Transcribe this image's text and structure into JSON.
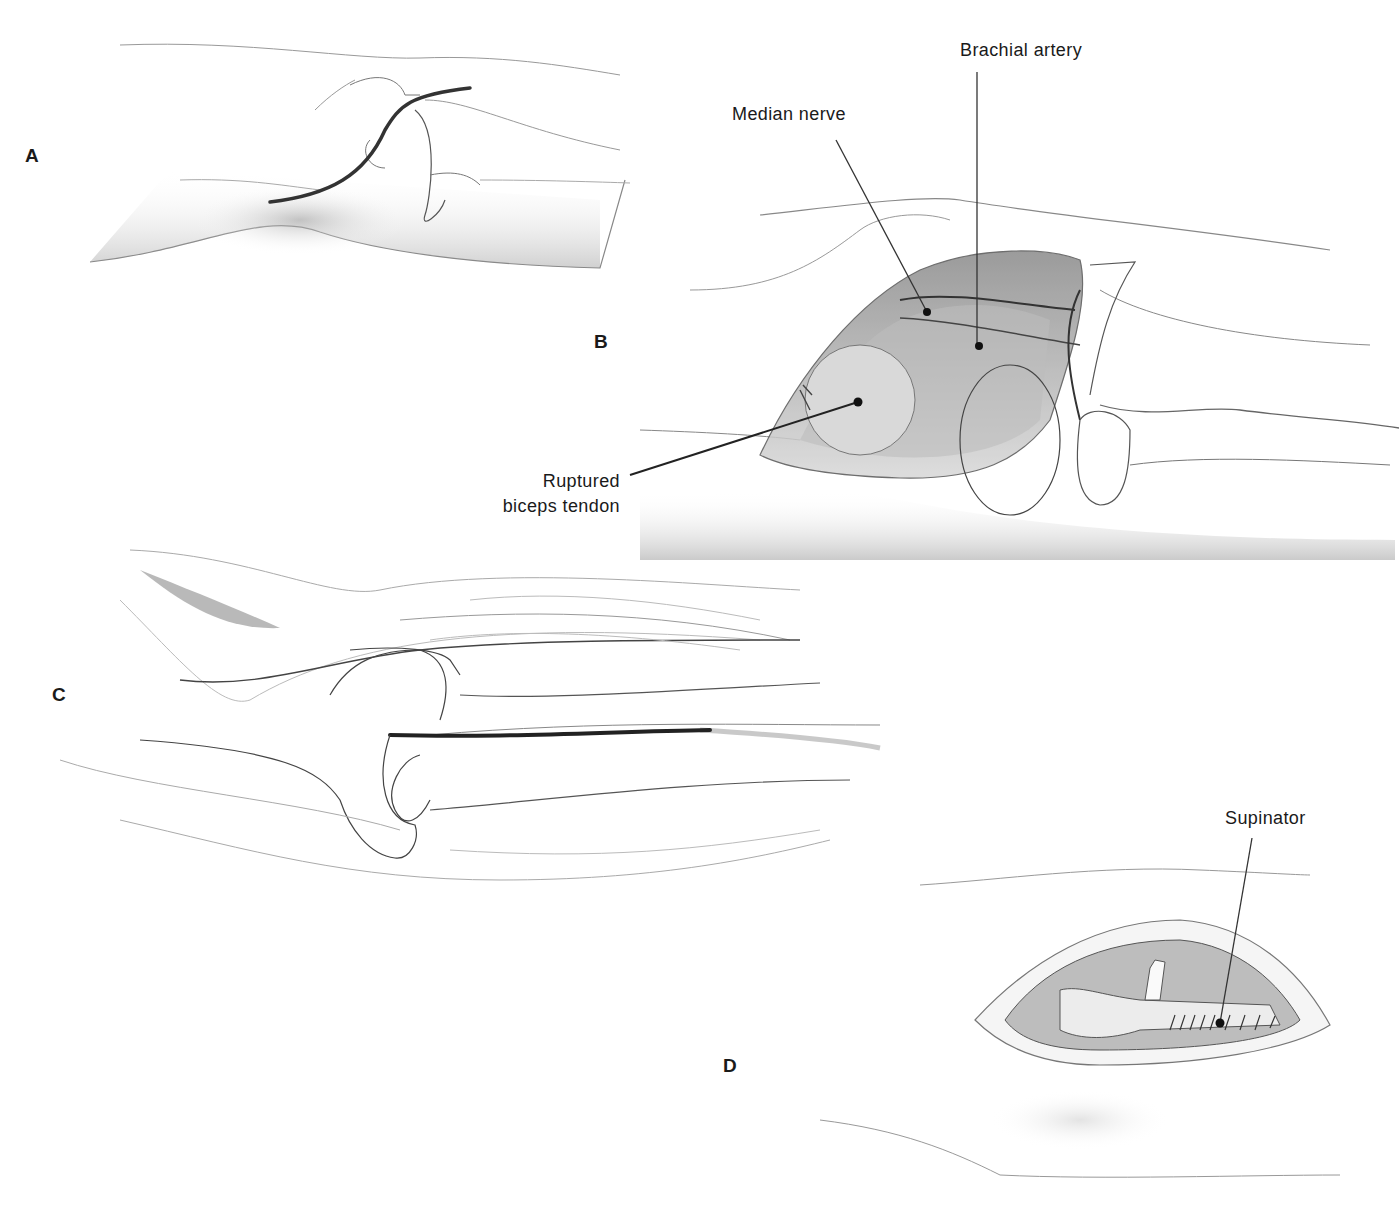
{
  "figure": {
    "panels": [
      {
        "id": "A",
        "letter": "A"
      },
      {
        "id": "B",
        "letter": "B"
      },
      {
        "id": "C",
        "letter": "C"
      },
      {
        "id": "D",
        "letter": "D"
      }
    ],
    "labels": {
      "brachial_artery": "Brachial artery",
      "median_nerve": "Median nerve",
      "ruptured_line1": "Ruptured",
      "ruptured_line2": "biceps tendon",
      "supinator": "Supinator"
    },
    "colors": {
      "ink": "#1a1a1a",
      "line": "#555555",
      "shade": "#bdbdbd",
      "background": "#ffffff"
    }
  }
}
